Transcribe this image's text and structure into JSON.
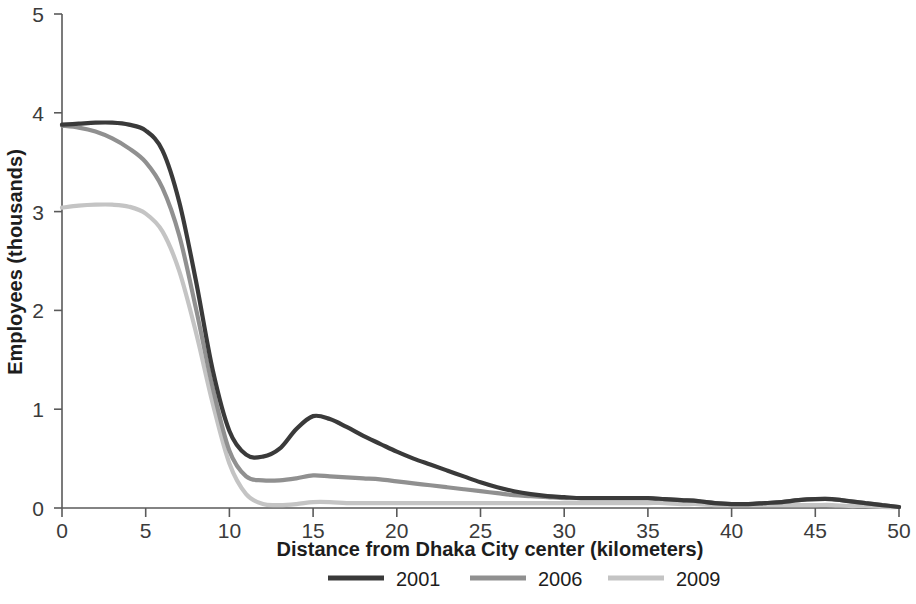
{
  "chart_data": {
    "type": "line",
    "title": "",
    "xlabel": "Distance from Dhaka City center (kilometers)",
    "ylabel": "Employees (thousands)",
    "xlim": [
      0,
      50
    ],
    "ylim": [
      0,
      5
    ],
    "xticks": [
      0,
      5,
      10,
      15,
      20,
      25,
      30,
      35,
      40,
      45,
      50
    ],
    "yticks": [
      0,
      1,
      2,
      3,
      4,
      5
    ],
    "xtick_labels": [
      "0",
      "5",
      "10",
      "15",
      "20",
      "25",
      "30",
      "35",
      "40",
      "45",
      "50"
    ],
    "ytick_labels": [
      "0",
      "1",
      "2",
      "3",
      "4",
      "5"
    ],
    "grid": false,
    "legend_position": "bottom-center",
    "x": [
      0,
      1,
      2,
      3,
      4,
      5,
      6,
      7,
      8,
      9,
      10,
      11,
      12,
      13,
      14,
      15,
      16,
      17,
      18,
      19,
      20,
      21,
      22,
      23,
      24,
      25,
      26,
      27,
      28,
      29,
      30,
      31,
      32,
      33,
      34,
      35,
      36,
      37,
      38,
      39,
      40,
      41,
      42,
      43,
      44,
      45,
      46,
      47,
      48,
      49,
      50
    ],
    "series": [
      {
        "name": "2001",
        "color": "#3a3a3a",
        "values": [
          3.88,
          3.89,
          3.9,
          3.9,
          3.88,
          3.82,
          3.62,
          3.1,
          2.3,
          1.4,
          0.78,
          0.54,
          0.52,
          0.6,
          0.8,
          0.93,
          0.9,
          0.82,
          0.73,
          0.65,
          0.57,
          0.5,
          0.44,
          0.38,
          0.32,
          0.26,
          0.21,
          0.17,
          0.14,
          0.12,
          0.11,
          0.1,
          0.1,
          0.1,
          0.1,
          0.1,
          0.09,
          0.08,
          0.07,
          0.05,
          0.04,
          0.04,
          0.05,
          0.06,
          0.08,
          0.09,
          0.09,
          0.07,
          0.05,
          0.03,
          0.01
        ]
      },
      {
        "name": "2006",
        "color": "#909090",
        "values": [
          3.87,
          3.85,
          3.81,
          3.74,
          3.64,
          3.5,
          3.24,
          2.76,
          2.02,
          1.22,
          0.58,
          0.32,
          0.28,
          0.28,
          0.3,
          0.33,
          0.32,
          0.31,
          0.3,
          0.29,
          0.27,
          0.25,
          0.23,
          0.21,
          0.19,
          0.17,
          0.15,
          0.13,
          0.12,
          0.11,
          0.1,
          0.1,
          0.1,
          0.1,
          0.1,
          0.1,
          0.09,
          0.08,
          0.07,
          0.05,
          0.04,
          0.04,
          0.05,
          0.06,
          0.08,
          0.09,
          0.09,
          0.07,
          0.05,
          0.03,
          0.01
        ]
      },
      {
        "name": "2009",
        "color": "#c4c4c4",
        "values": [
          3.04,
          3.06,
          3.07,
          3.07,
          3.05,
          2.98,
          2.8,
          2.4,
          1.78,
          1.06,
          0.45,
          0.14,
          0.04,
          0.03,
          0.04,
          0.06,
          0.06,
          0.05,
          0.05,
          0.05,
          0.05,
          0.05,
          0.05,
          0.05,
          0.05,
          0.05,
          0.05,
          0.05,
          0.05,
          0.05,
          0.05,
          0.05,
          0.05,
          0.05,
          0.05,
          0.05,
          0.05,
          0.04,
          0.04,
          0.03,
          0.03,
          0.03,
          0.03,
          0.03,
          0.03,
          0.03,
          0.03,
          0.02,
          0.02,
          0.01,
          0.01
        ]
      }
    ],
    "legend": [
      {
        "label": "2001",
        "color": "#3a3a3a"
      },
      {
        "label": "2006",
        "color": "#909090"
      },
      {
        "label": "2009",
        "color": "#c4c4c4"
      }
    ],
    "annotations": []
  },
  "axes": {
    "x_title": "Distance from Dhaka City center (kilometers)",
    "y_title": "Employees (thousands)"
  }
}
